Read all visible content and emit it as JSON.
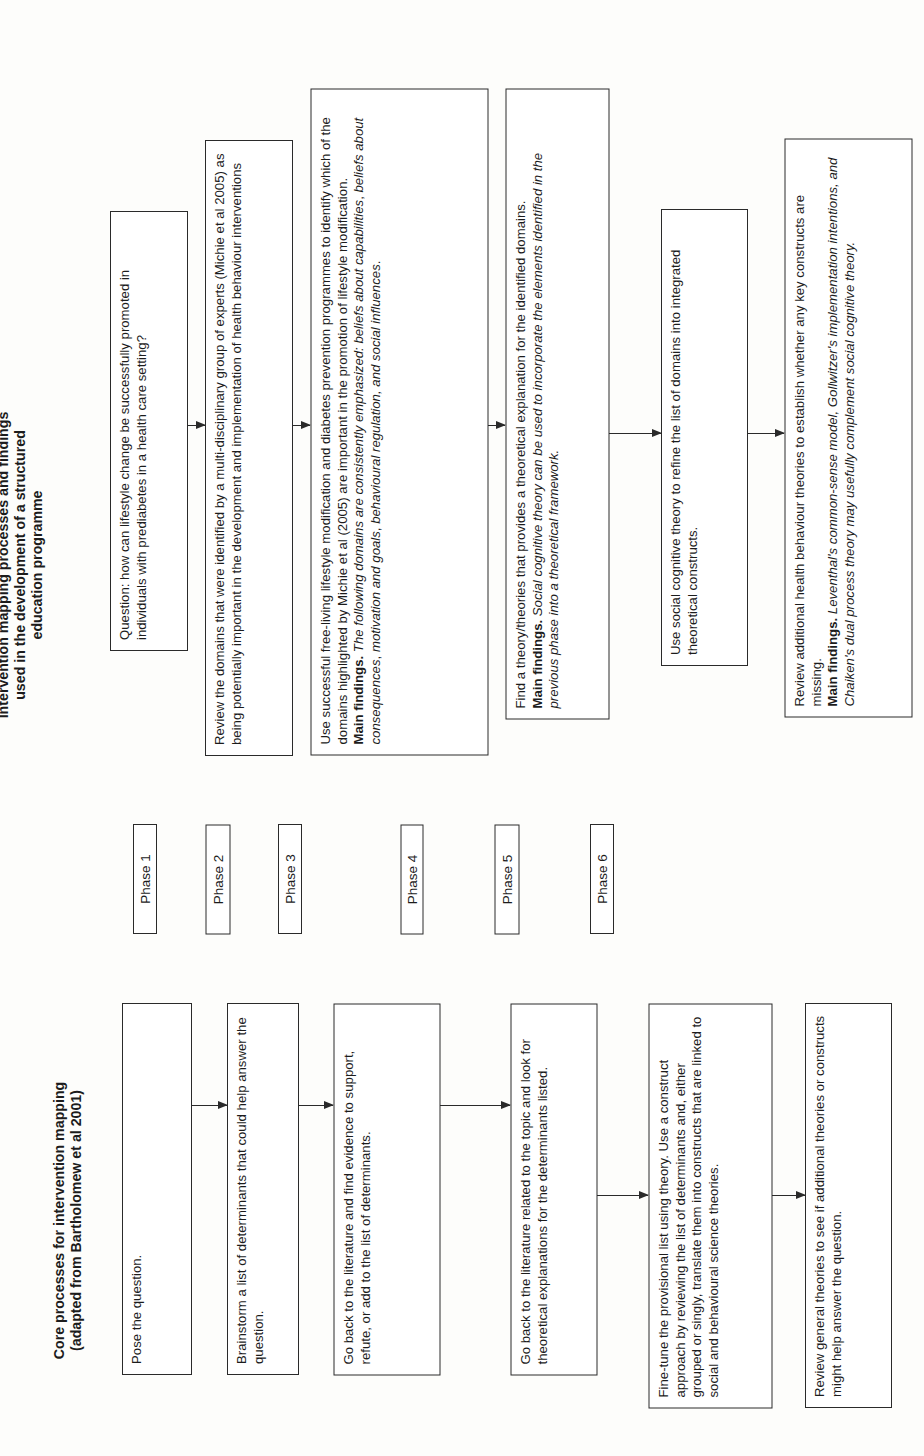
{
  "left_panel": {
    "title": "Core processes for intervention mapping (adapted from Bartholomew et al 2001)",
    "steps": [
      {
        "text": "Pose the question."
      },
      {
        "text": "Brainstorm a list of determinants that could help answer the question."
      },
      {
        "text": "Go back to the literature and find evidence to support, refute, or add to the list of determinants."
      },
      {
        "text": "Go back to the literature related to the topic and look for theoretical explanations for the determinants listed."
      },
      {
        "text": "Fine-tune the provisional list using theory. Use a construct approach by reviewing the list of determinants and, either grouped or singly, translate them into constructs that are linked to social and behavioural science theories."
      },
      {
        "text": "Review general theories to see if additional theories or constructs might help answer the question."
      }
    ]
  },
  "phases": [
    "Phase 1",
    "Phase 2",
    "Phase 3",
    "Phase 4",
    "Phase 5",
    "Phase 6"
  ],
  "right_panel": {
    "title": "Intervention mapping processes and findings used in the development of a structured education programme",
    "steps": [
      {
        "text": "Question: how can lifestyle change be successfully promoted in individuals with prediabetes in a health care setting?",
        "findings_label": "",
        "findings": ""
      },
      {
        "text": "Review the domains that were identified by a multi-disciplinary group of experts (Michie et al 2005) as being potentially important in the development and implementation of health behaviour interventions",
        "findings_label": "",
        "findings": ""
      },
      {
        "text": "Use successful free-living lifestyle modification and diabetes prevention programmes to identify which of the domains highlighted by Michie et al (2005) are important in the promotion of lifestyle modification.",
        "findings_label": "Main findings.",
        "findings_parts": [
          "The following domains are consistently emphasized: ",
          "beliefs about capabilities",
          ", ",
          "beliefs about consequences",
          ", ",
          "motivation and goals",
          ", ",
          "behavioural regulation",
          ", and ",
          "social influences",
          "."
        ]
      },
      {
        "text": "Find a theory/theories that provides a theoretical explanation for the identified domains.",
        "findings_label": "Main findings.",
        "findings": "Social cognitive theory can be used to incorporate the elements identified in the previous phase into a theoretical framework."
      },
      {
        "text": "Use social cognitive theory to refine the list of domains into integrated theoretical constructs.",
        "findings_label": "",
        "findings": ""
      },
      {
        "text": "Review additional health behaviour theories to establish whether any key constructs are missing.",
        "findings_label": "Main findings.",
        "findings": "Leventhal's common-sense model, Gollwitzer's implementation intentions, and Chaiken's dual process theory may usefully complement social cognitive theory."
      }
    ]
  },
  "colors": {
    "line": "#2a2a2a",
    "background": "#fdfdfb",
    "text": "#1c1c1c"
  }
}
